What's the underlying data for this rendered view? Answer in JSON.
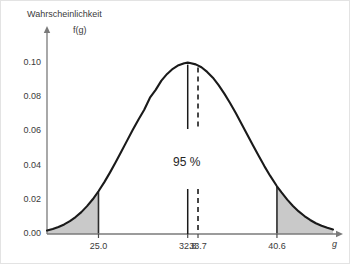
{
  "figure": {
    "background": "#ffffff",
    "border_color": "#e3e3e3",
    "curve_color": "#1a1a1a",
    "axis_color": "#7a7a7a",
    "shade_color": "#c9c9c9",
    "text_color": "#3a3a3a"
  },
  "chart_data": {
    "type": "line",
    "title": "",
    "subtitle": "",
    "ylabel_line1": "Wahrscheinlichkeit",
    "ylabel_line2": "f(g)",
    "xlabel": "g",
    "grid": false,
    "legend": "none",
    "distribution": "normal",
    "mean": 32.8,
    "sigma": 3.98,
    "peak_value": 0.1,
    "xlim": [
      20.5,
      45.5
    ],
    "ylim": [
      0.0,
      0.112
    ],
    "y_ticks": [
      "0.00",
      "0.02",
      "0.04",
      "0.06",
      "0.08",
      "0.10"
    ],
    "y_tick_values": [
      0.0,
      0.02,
      0.04,
      0.06,
      0.08,
      0.1
    ],
    "x_ticks": [
      "25.0",
      "32.8",
      "33.7",
      "40.6"
    ],
    "x_tick_values": [
      25.0,
      32.8,
      33.7,
      40.6
    ],
    "confidence_label": "95 %",
    "confidence_interval": [
      25.0,
      40.6
    ],
    "markers": [
      {
        "name": "mean-line",
        "x": 32.8,
        "style": "solid"
      },
      {
        "name": "reference-line",
        "x": 33.7,
        "style": "dashed"
      }
    ],
    "shaded_tails": [
      {
        "name": "left-tail",
        "from": 20.5,
        "to": 25.0
      },
      {
        "name": "right-tail",
        "from": 40.6,
        "to": 45.5
      }
    ],
    "x": [
      20.5,
      21.0,
      21.5,
      22.0,
      22.5,
      23.0,
      23.5,
      24.0,
      24.5,
      25.0,
      25.5,
      26.0,
      26.5,
      27.0,
      27.5,
      28.0,
      28.5,
      29.0,
      29.5,
      30.0,
      30.5,
      31.0,
      31.5,
      32.0,
      32.5,
      32.8,
      33.0,
      33.5,
      34.0,
      34.5,
      35.0,
      35.5,
      36.0,
      36.5,
      37.0,
      37.5,
      38.0,
      38.5,
      39.0,
      39.5,
      40.0,
      40.6,
      41.0,
      41.5,
      42.0,
      42.5,
      43.0,
      43.5,
      44.0,
      44.5,
      45.0,
      45.5
    ],
    "y": [
      0.002,
      0.0029,
      0.0041,
      0.0056,
      0.0075,
      0.0099,
      0.0128,
      0.0163,
      0.0203,
      0.025,
      0.0302,
      0.0359,
      0.0419,
      0.0482,
      0.0546,
      0.0609,
      0.067,
      0.0727,
      0.0797,
      0.0843,
      0.0897,
      0.0936,
      0.0966,
      0.0987,
      0.0999,
      0.1002,
      0.1,
      0.0992,
      0.0975,
      0.0948,
      0.0914,
      0.0871,
      0.0821,
      0.0766,
      0.0707,
      0.0645,
      0.0582,
      0.0519,
      0.0457,
      0.0397,
      0.0341,
      0.0279,
      0.0243,
      0.0201,
      0.0164,
      0.0132,
      0.0105,
      0.0082,
      0.0063,
      0.0048,
      0.0036,
      0.0026
    ]
  }
}
